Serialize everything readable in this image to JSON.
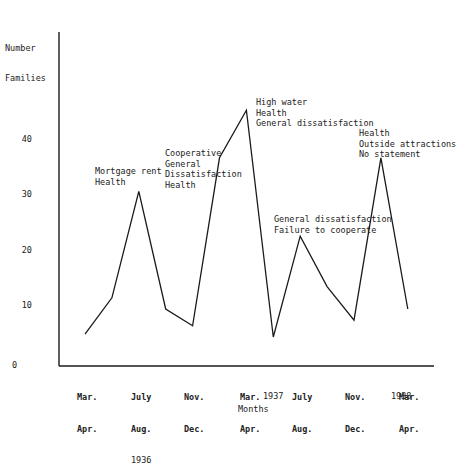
{
  "chart_data": {
    "type": "line",
    "title": "",
    "xlabel": "Months",
    "ylabel": "Number Families",
    "ylim": [
      0,
      50
    ],
    "yticks": [
      0,
      10,
      20,
      30,
      40
    ],
    "grid": false,
    "legend": null,
    "x": [
      "Mar.-Apr. 1936",
      "May-June 1936",
      "July-Aug. 1936",
      "Sept.-Oct. 1936",
      "Nov.-Dec. 1936",
      "Jan.-Feb. 1937",
      "Mar.-Apr. 1937",
      "May-June 1937",
      "July-Aug. 1937",
      "Sept.-Oct. 1937",
      "Nov.-Dec. 1937",
      "Jan.-Feb. 1938",
      "Mar.-Apr. 1938"
    ],
    "series": [
      {
        "name": "Families",
        "values": [
          5.5,
          12,
          31,
          10,
          7,
          37,
          45.5,
          5,
          23,
          14,
          8,
          37,
          10
        ]
      }
    ],
    "xtick_labels": [
      {
        "text": "Mar.\nApr.",
        "year": ""
      },
      {
        "text": "July\nAug.",
        "year": "1936"
      },
      {
        "text": "Nov.\nDec.",
        "year": ""
      },
      {
        "text": "Mar.\nApr.",
        "year": "1937"
      },
      {
        "text": "July\nAug.",
        "year": ""
      },
      {
        "text": "Nov.\nDec.",
        "year": ""
      },
      {
        "text": "Mar.\nApr.",
        "year": "1938"
      }
    ],
    "annotations": [
      {
        "point": "July-Aug. 1936",
        "text": "Mortgage rent\nHealth"
      },
      {
        "point": "Jan.-Feb. 1937",
        "text": "Cooperative\nGeneral\nDissatisfaction\nHealth"
      },
      {
        "point": "Mar.-Apr. 1937",
        "text": "High water\nHealth\nGeneral dissatisfaction"
      },
      {
        "point": "July-Aug. 1937",
        "text": "General dissatisfaction\nFailure to cooperate"
      },
      {
        "point": "Jan.-Feb. 1938",
        "text": "Health\nOutside attractions\nNo statement"
      }
    ]
  },
  "axes": {
    "ylabel_line1": "Number",
    "ylabel_line2": "Families",
    "xlabel": "Months",
    "yticks": [
      "0",
      "10",
      "20",
      "30",
      "40"
    ],
    "xticks": [
      {
        "line1": "Mar.",
        "line2": "Apr.",
        "year": ""
      },
      {
        "line1": "July",
        "line2": "Aug.",
        "year": "1936"
      },
      {
        "line1": "Nov.",
        "line2": "Dec.",
        "year": ""
      },
      {
        "line1": "Mar.",
        "line2": "Apr.",
        "year": "1937"
      },
      {
        "line1": "July",
        "line2": "Aug.",
        "year": ""
      },
      {
        "line1": "Nov.",
        "line2": "Dec.",
        "year": ""
      },
      {
        "line1": "Mar.",
        "line2": "Apr.",
        "year": "1938"
      }
    ]
  },
  "notes": {
    "n1": "Mortgage rent\nHealth",
    "n2": "Cooperative\nGeneral\nDissatisfaction\nHealth",
    "n3": "High water\nHealth\nGeneral dissatisfaction",
    "n4": "General dissatisfaction\nFailure to cooperate",
    "n5": "Health\nOutside attractions\nNo statement"
  },
  "style": {
    "line_color": "#1a1a1a",
    "axis_color": "#1a1a1a",
    "background": "#ffffff"
  }
}
